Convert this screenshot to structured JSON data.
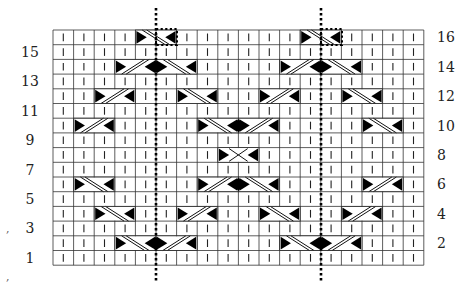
{
  "chart_title": "Cable knitting chart",
  "grid": {
    "columns": 18,
    "rows": 16,
    "origin_x": 53,
    "origin_y": 30,
    "cell_width": 20.6,
    "cell_height": 14.7,
    "grid_color": "#333333",
    "stitch_mark": "|",
    "triangle_color": "#000000"
  },
  "row_labels_left": [
    "15",
    "13",
    "11",
    "9",
    "7",
    "5",
    "3",
    "1"
  ],
  "row_labels_right": [
    "16",
    "14",
    "12",
    "10",
    "8",
    "6",
    "4",
    "2"
  ],
  "legend_symbols": {
    "knit": "vertical-bar",
    "cable_right_leaning": "slash",
    "cable_left_leaning": "backslash",
    "cable_cross": "cross"
  },
  "cables": [
    {
      "row": 16,
      "col": 4,
      "dir": "back"
    },
    {
      "row": 16,
      "col": 12,
      "dir": "back"
    },
    {
      "row": 14,
      "col": 3,
      "dir": "fwd"
    },
    {
      "row": 14,
      "col": 5,
      "dir": "back"
    },
    {
      "row": 14,
      "col": 11,
      "dir": "fwd"
    },
    {
      "row": 14,
      "col": 13,
      "dir": "back"
    },
    {
      "row": 12,
      "col": 2,
      "dir": "fwd"
    },
    {
      "row": 12,
      "col": 6,
      "dir": "back"
    },
    {
      "row": 12,
      "col": 10,
      "dir": "fwd"
    },
    {
      "row": 12,
      "col": 14,
      "dir": "back"
    },
    {
      "row": 10,
      "col": 1,
      "dir": "fwd"
    },
    {
      "row": 10,
      "col": 7,
      "dir": "back"
    },
    {
      "row": 10,
      "col": 9,
      "dir": "fwd"
    },
    {
      "row": 10,
      "col": 15,
      "dir": "back"
    },
    {
      "row": 8,
      "col": 8,
      "dir": "cross"
    },
    {
      "row": 6,
      "col": 1,
      "dir": "back"
    },
    {
      "row": 6,
      "col": 7,
      "dir": "fwd"
    },
    {
      "row": 6,
      "col": 9,
      "dir": "back"
    },
    {
      "row": 6,
      "col": 15,
      "dir": "fwd"
    },
    {
      "row": 4,
      "col": 2,
      "dir": "back"
    },
    {
      "row": 4,
      "col": 6,
      "dir": "fwd"
    },
    {
      "row": 4,
      "col": 10,
      "dir": "back"
    },
    {
      "row": 4,
      "col": 14,
      "dir": "fwd"
    },
    {
      "row": 2,
      "col": 3,
      "dir": "back"
    },
    {
      "row": 2,
      "col": 5,
      "dir": "fwd"
    },
    {
      "row": 2,
      "col": 11,
      "dir": "back"
    },
    {
      "row": 2,
      "col": 13,
      "dir": "fwd"
    }
  ],
  "dotted_center_lines": [
    {
      "x": 156,
      "y1": 8,
      "y2": 283
    },
    {
      "x": 321,
      "y1": 8,
      "y2": 283
    }
  ],
  "dotted_boxes": [
    {
      "x": 156,
      "y": 29,
      "w": 21,
      "h": 16
    },
    {
      "x": 321,
      "y": 29,
      "w": 21,
      "h": 16
    }
  ],
  "artifacts": [
    ",",
    ","
  ]
}
